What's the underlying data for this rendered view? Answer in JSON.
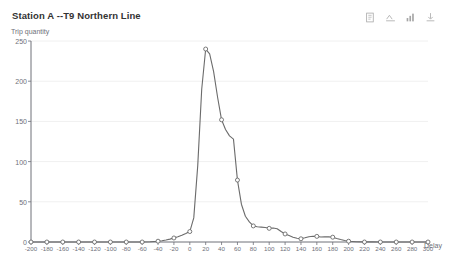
{
  "header": {
    "title": "Station A  --T9 Northern Line"
  },
  "toolbox": {
    "items": [
      {
        "name": "data-view-icon",
        "label": "Data View"
      },
      {
        "name": "line-bar-switch-icon",
        "label": "Switch Line/Bar"
      },
      {
        "name": "magic-type-icon",
        "label": "Magic Type"
      },
      {
        "name": "save-image-icon",
        "label": "Save as Image"
      }
    ]
  },
  "colors": {
    "line": "#6b6b6b",
    "axis": "#6e7079",
    "grid": "#f0f0f0",
    "background": "#ffffff",
    "marker_fill": "#ffffff"
  },
  "chart_data": {
    "type": "line",
    "title": "Station A  --T9 Northern Line",
    "xlabel": "Delay",
    "ylabel": "Trip quantity",
    "xlim": [
      -200,
      300
    ],
    "ylim": [
      0,
      250
    ],
    "grid": true,
    "legend": null,
    "x_ticks": [
      -200,
      -180,
      -160,
      -140,
      -120,
      -100,
      -80,
      -60,
      -40,
      -20,
      0,
      20,
      40,
      60,
      80,
      100,
      120,
      140,
      160,
      180,
      200,
      220,
      240,
      260,
      280,
      300
    ],
    "y_ticks": [
      0,
      50,
      100,
      150,
      200,
      250
    ],
    "x_tick_labels": [
      "-200",
      "-180",
      "-160",
      "-140",
      "-120",
      "-100",
      "-80",
      "-60",
      "-40",
      "-20",
      "0",
      "20",
      "40",
      "60",
      "80",
      "100",
      "120",
      "140",
      "160",
      "180",
      "200",
      "220",
      "240",
      "260",
      "280",
      "300"
    ],
    "y_tick_labels": [
      "0",
      "50",
      "100",
      "150",
      "200",
      "250"
    ],
    "series": [
      {
        "name": "Trip quantity",
        "x": [
          -200,
          -180,
          -160,
          -140,
          -120,
          -100,
          -80,
          -60,
          -40,
          -20,
          0,
          20,
          40,
          60,
          80,
          100,
          120,
          140,
          160,
          180,
          200,
          220,
          240,
          260,
          280,
          300
        ],
        "values": [
          0,
          0,
          0,
          0,
          0,
          0,
          0,
          0,
          1,
          5,
          13,
          240,
          152,
          77,
          20,
          17,
          10,
          4,
          7,
          6,
          1,
          0,
          0,
          0,
          0,
          0
        ]
      }
    ],
    "dense_x": [
      -200,
      -190,
      -180,
      -170,
      -160,
      -150,
      -140,
      -130,
      -120,
      -110,
      -100,
      -90,
      -80,
      -70,
      -60,
      -50,
      -40,
      -35,
      -30,
      -25,
      -20,
      -15,
      -10,
      -5,
      0,
      5,
      10,
      15,
      20,
      25,
      30,
      35,
      40,
      45,
      50,
      55,
      60,
      65,
      70,
      75,
      80,
      85,
      90,
      95,
      100,
      105,
      110,
      115,
      120,
      125,
      130,
      135,
      140,
      145,
      150,
      155,
      160,
      165,
      170,
      175,
      180,
      185,
      190,
      195,
      200,
      210,
      220,
      230,
      240,
      250,
      260,
      270,
      280,
      290,
      300
    ],
    "dense_values": [
      0,
      0,
      0,
      0,
      0,
      0,
      0,
      0,
      0,
      0,
      0,
      0,
      0,
      0,
      0,
      0.3,
      1,
      1.6,
      2.5,
      3.6,
      5,
      6.5,
      8.4,
      10.6,
      13,
      30,
      95,
      190,
      240,
      234,
      212,
      180,
      152,
      140,
      132,
      128,
      77,
      47,
      32,
      25,
      20,
      19,
      18.5,
      18,
      17,
      17.5,
      16.5,
      13,
      10,
      8,
      6,
      4.6,
      4,
      5.2,
      6.6,
      7.2,
      7,
      6.2,
      6.6,
      6.4,
      6,
      4.4,
      3,
      1.8,
      1,
      0.4,
      0.2,
      0.1,
      0,
      0,
      0,
      0,
      0,
      0,
      0
    ]
  }
}
